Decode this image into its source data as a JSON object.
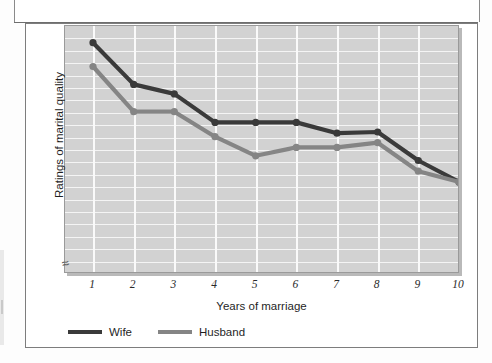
{
  "chart_data": {
    "type": "line",
    "title": "",
    "xlabel": "Years of marriage",
    "ylabel": "Ratings of marital quality",
    "x": [
      1,
      2,
      3,
      4,
      5,
      6,
      7,
      8,
      9,
      10
    ],
    "xtick_labels": [
      "1",
      "2",
      "3",
      "4",
      "5",
      "6",
      "7",
      "8",
      "9",
      "10"
    ],
    "ylim": [
      0,
      20
    ],
    "ytick_labels": [],
    "grid": true,
    "legend_position": "below-axis-left",
    "y_axis_break": true,
    "series": [
      {
        "name": "Wife",
        "color": "#3a3a3a",
        "values": [
          19.1,
          15.6,
          14.8,
          12.4,
          12.4,
          12.4,
          11.5,
          11.6,
          9.2,
          7.4
        ]
      },
      {
        "name": "Husband",
        "color": "#858585",
        "values": [
          17.1,
          13.3,
          13.3,
          11.2,
          9.6,
          10.3,
          10.3,
          10.7,
          8.3,
          7.4
        ]
      }
    ]
  },
  "axis": {
    "x_title": "Years of marriage",
    "y_title": "Ratings of marital quality",
    "break_symbol": "≈"
  },
  "legend": {
    "items": [
      {
        "label": "Wife",
        "color": "#3a3a3a"
      },
      {
        "label": "Husband",
        "color": "#858585"
      }
    ]
  }
}
